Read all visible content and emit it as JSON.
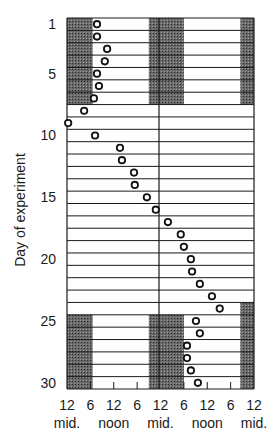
{
  "chart_data": {
    "type": "scatter",
    "subtype": "double-plotted actogram",
    "title": "",
    "ylabel": "Day of experiment",
    "xlabel": "",
    "y_ticks": [
      1,
      5,
      10,
      15,
      20,
      25,
      30
    ],
    "x_tick_labels": [
      "12",
      "6",
      "12",
      "6",
      "12",
      "6",
      "12",
      "6",
      "12"
    ],
    "x_tick_sublabels": [
      {
        "at": 0,
        "text": "mid."
      },
      {
        "at": 12,
        "text": "noon"
      },
      {
        "at": 24,
        "text": "mid."
      },
      {
        "at": 36,
        "text": "noon"
      },
      {
        "at": 48,
        "text": "mid."
      }
    ],
    "x_range_hours": [
      0,
      48
    ],
    "days": 30,
    "dark_periods": [
      {
        "days": [
          1,
          7
        ],
        "hours": [
          [
            0,
            6.6
          ],
          [
            21,
            30
          ],
          [
            44.5,
            48
          ]
        ]
      },
      {
        "days": [
          24,
          24
        ],
        "hours": [
          [
            44.5,
            48
          ]
        ]
      },
      {
        "days": [
          25,
          30
        ],
        "hours": [
          [
            0,
            6.6
          ],
          [
            21,
            30
          ],
          [
            44.5,
            48
          ]
        ]
      }
    ],
    "events_hour_of_double_plot": [
      {
        "day": 1,
        "hour": 7.7
      },
      {
        "day": 2,
        "hour": 7.7
      },
      {
        "day": 3,
        "hour": 10.3
      },
      {
        "day": 4,
        "hour": 9.7
      },
      {
        "day": 5,
        "hour": 7.7
      },
      {
        "day": 6,
        "hour": 8.2
      },
      {
        "day": 7,
        "hour": 6.9
      },
      {
        "day": 8,
        "hour": 4.4
      },
      {
        "day": 9,
        "hour": 0.3
      },
      {
        "day": 10,
        "hour": 7.2
      },
      {
        "day": 11,
        "hour": 13.6
      },
      {
        "day": 12,
        "hour": 14.1
      },
      {
        "day": 13,
        "hour": 17.2
      },
      {
        "day": 14,
        "hour": 17.4
      },
      {
        "day": 15,
        "hour": 20.5
      },
      {
        "day": 16,
        "hour": 22.8
      },
      {
        "day": 17,
        "hour": 25.9
      },
      {
        "day": 18,
        "hour": 29.2
      },
      {
        "day": 19,
        "hour": 30.0
      },
      {
        "day": 20,
        "hour": 31.8
      },
      {
        "day": 21,
        "hour": 32.1
      },
      {
        "day": 22,
        "hour": 34.1
      },
      {
        "day": 23,
        "hour": 37.2
      },
      {
        "day": 24,
        "hour": 39.2
      },
      {
        "day": 25,
        "hour": 33.1
      },
      {
        "day": 26,
        "hour": 34.1
      },
      {
        "day": 27,
        "hour": 30.8
      },
      {
        "day": 28,
        "hour": 30.8
      },
      {
        "day": 29,
        "hour": 31.8
      },
      {
        "day": 30,
        "hour": 33.6
      }
    ],
    "grid": true,
    "legend": null
  }
}
